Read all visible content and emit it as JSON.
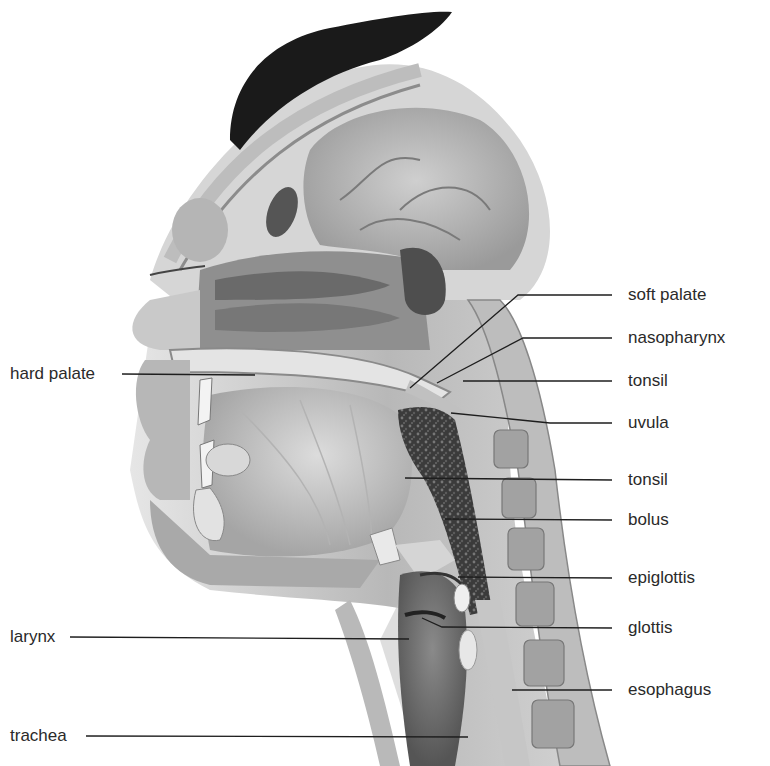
{
  "figure": {
    "labels_right": [
      {
        "id": "soft-palate",
        "text": "soft palate",
        "x": 628,
        "y": 295,
        "line": [
          [
            612,
            295
          ],
          [
            518,
            295
          ],
          [
            410,
            388
          ]
        ]
      },
      {
        "id": "nasopharynx",
        "text": "nasopharynx",
        "x": 628,
        "y": 338,
        "line": [
          [
            612,
            338
          ],
          [
            523,
            338
          ],
          [
            437,
            383
          ]
        ]
      },
      {
        "id": "tonsil-upper",
        "text": "tonsil",
        "x": 628,
        "y": 381,
        "line": [
          [
            612,
            381
          ],
          [
            463,
            381
          ]
        ]
      },
      {
        "id": "uvula",
        "text": "uvula",
        "x": 628,
        "y": 423,
        "line": [
          [
            612,
            423
          ],
          [
            550,
            423
          ],
          [
            451,
            413
          ]
        ]
      },
      {
        "id": "tonsil-lower",
        "text": "tonsil",
        "x": 628,
        "y": 480,
        "line": [
          [
            612,
            480
          ],
          [
            405,
            478
          ]
        ]
      },
      {
        "id": "bolus",
        "text": "bolus",
        "x": 628,
        "y": 520,
        "line": [
          [
            612,
            520
          ],
          [
            445,
            519
          ]
        ]
      },
      {
        "id": "epiglottis",
        "text": "epiglottis",
        "x": 628,
        "y": 578,
        "line": [
          [
            612,
            578
          ],
          [
            458,
            577
          ]
        ]
      },
      {
        "id": "glottis",
        "text": "glottis",
        "x": 628,
        "y": 628,
        "line": [
          [
            612,
            628
          ],
          [
            442,
            627
          ],
          [
            422,
            618
          ]
        ]
      },
      {
        "id": "esophagus",
        "text": "esophagus",
        "x": 628,
        "y": 690,
        "line": [
          [
            612,
            690
          ],
          [
            512,
            690
          ]
        ]
      }
    ],
    "labels_left": [
      {
        "id": "hard-palate",
        "text": "hard palate",
        "x": 10,
        "y": 374,
        "line": [
          [
            122,
            374
          ],
          [
            255,
            375
          ]
        ]
      },
      {
        "id": "larynx",
        "text": "larynx",
        "x": 10,
        "y": 637,
        "line": [
          [
            70,
            637
          ],
          [
            409,
            639
          ]
        ]
      },
      {
        "id": "trachea",
        "text": "trachea",
        "x": 10,
        "y": 736,
        "line": [
          [
            86,
            736
          ],
          [
            468,
            737
          ]
        ]
      }
    ],
    "colors": {
      "background": "#ffffff",
      "label_text": "#2a2a2a",
      "leader_line": "#1e1e1e",
      "hair": "#1a1a1a",
      "tissue_light": "#d4d4d4",
      "tissue_mid": "#a8a8a8",
      "tissue_dark": "#6e6e6e",
      "bolus": "#3a3a3a"
    }
  }
}
